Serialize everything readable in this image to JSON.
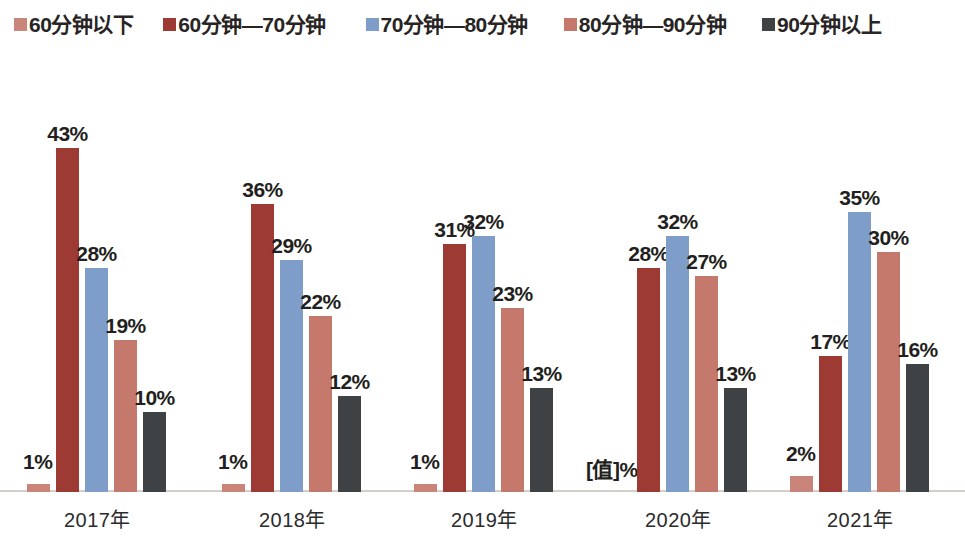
{
  "chart_data": {
    "type": "bar",
    "title": "",
    "subtitle": "",
    "xlabel": "",
    "ylabel": "",
    "ylim": [
      0,
      50
    ],
    "grid": false,
    "legend_position": "top",
    "categories": [
      "2017年",
      "2018年",
      "2019年",
      "2020年",
      "2021年"
    ],
    "series": [
      {
        "name": "60分钟以下",
        "color": "#c98579",
        "values": [
          1,
          1,
          1,
          0,
          2
        ],
        "labels": [
          "1%",
          "1%",
          "1%",
          "[值]%",
          "2%"
        ]
      },
      {
        "name": "60分钟—70分钟",
        "color": "#9c3a33",
        "values": [
          43,
          36,
          31,
          28,
          17
        ],
        "labels": [
          "43%",
          "36%",
          "31%",
          "28%",
          "17%"
        ]
      },
      {
        "name": "70分钟—80分钟",
        "color": "#7f9dc9",
        "values": [
          28,
          29,
          32,
          32,
          35
        ],
        "labels": [
          "28%",
          "29%",
          "32%",
          "32%",
          "35%"
        ]
      },
      {
        "name": "80分钟—90分钟",
        "color": "#c4796c",
        "values": [
          19,
          22,
          23,
          27,
          30
        ],
        "labels": [
          "19%",
          "22%",
          "23%",
          "27%",
          "30%"
        ]
      },
      {
        "name": "90分钟以上",
        "color": "#3f4245",
        "values": [
          10,
          12,
          13,
          13,
          16
        ],
        "labels": [
          "10%",
          "12%",
          "13%",
          "13%",
          "16%"
        ]
      }
    ]
  },
  "legend": {
    "items": [
      {
        "label": "60分钟以下",
        "color": "#c98579"
      },
      {
        "label": "60分钟—70分钟",
        "color": "#9c3a33"
      },
      {
        "label": "70分钟—80分钟",
        "color": "#7f9dc9"
      },
      {
        "label": "80分钟—90分钟",
        "color": "#c4796c"
      },
      {
        "label": "90分钟以上",
        "color": "#3f4245"
      }
    ]
  },
  "axis": {
    "baseline_color": "#d3cfca",
    "categories": [
      "2017年",
      "2018年",
      "2019年",
      "2020年",
      "2021年"
    ]
  }
}
